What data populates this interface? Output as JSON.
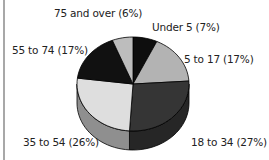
{
  "chart_data": {
    "type": "pie",
    "title": "",
    "style": "3d-pie",
    "categories": [
      "Under 5",
      "5 to 17",
      "18 to 34",
      "35 to 54",
      "55 to 74",
      "75 and over"
    ],
    "values": [
      7,
      17,
      27,
      26,
      17,
      6
    ],
    "unit": "%",
    "labels": [
      "Under 5  (7%)",
      "5 to 17 (17%)",
      "18 to 34 (27%)",
      "35 to 54 (26%)",
      "55 to 74 (17%)",
      "75 and over (6%)"
    ],
    "colors": [
      "#0e0e0e",
      "#b3b3b3",
      "#353535",
      "#dedede",
      "#111111",
      "#bdbdbd"
    ],
    "side_colors": [
      "#0a0a0a",
      "#8a8a8a",
      "#262626",
      "#8f8f8f",
      "#0b0b0b",
      "#909090"
    ],
    "legend": "none (direct labels)"
  }
}
